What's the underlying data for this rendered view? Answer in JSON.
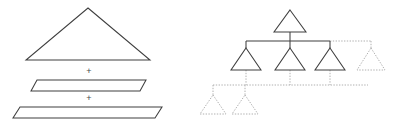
{
  "figure": {
    "width": 398,
    "height": 125,
    "background_color": "#ffffff",
    "solid_stroke_color": "#3f3f3f",
    "dotted_stroke_color": "#b0b0b0",
    "plus_label_color": "#4a4a4a"
  },
  "left_panel": {
    "name": "triangle-decomposition",
    "operators": [
      {
        "symbol": "+",
        "x": 89,
        "y": 72
      },
      {
        "symbol": "+",
        "x": 89,
        "y": 99
      }
    ],
    "shapes": [
      {
        "name": "apex-triangle",
        "kind": "triangle",
        "style": "solid",
        "points": "88,8 150,60 26,60"
      },
      {
        "name": "middle-slab",
        "kind": "parallelogram",
        "style": "solid",
        "points": "37,80 146,80 140,91 31,91"
      },
      {
        "name": "bottom-slab",
        "kind": "parallelogram",
        "style": "solid",
        "points": "20,107 162,107 155,118 13,118"
      }
    ]
  },
  "right_panel": {
    "name": "tree-expansion",
    "nodes": [
      {
        "name": "root-node",
        "style": "solid",
        "cx": 290,
        "cy": 10,
        "half_width": 16,
        "height": 22
      },
      {
        "name": "child-node-1",
        "style": "solid",
        "cx": 246,
        "cy": 48,
        "half_width": 15,
        "height": 22
      },
      {
        "name": "child-node-2",
        "style": "solid",
        "cx": 290,
        "cy": 48,
        "half_width": 15,
        "height": 22
      },
      {
        "name": "child-node-3",
        "style": "solid",
        "cx": 330,
        "cy": 48,
        "half_width": 15,
        "height": 22
      },
      {
        "name": "child-node-4",
        "style": "dotted",
        "cx": 371,
        "cy": 48,
        "half_width": 14,
        "height": 22
      },
      {
        "name": "grandchild-node-1",
        "style": "dotted",
        "cx": 213,
        "cy": 95,
        "half_width": 13,
        "height": 19
      },
      {
        "name": "grandchild-node-2",
        "style": "dotted",
        "cx": 245,
        "cy": 95,
        "half_width": 13,
        "height": 19
      }
    ],
    "edges": [
      {
        "name": "root-stem",
        "style": "solid",
        "path": "M290,32 L290,41"
      },
      {
        "name": "level1-bus-solid",
        "style": "solid",
        "path": "M246,41 L330,41"
      },
      {
        "name": "level1-bus-dotted",
        "style": "dotted",
        "path": "M330,41 L371,41"
      },
      {
        "name": "child-1-riser",
        "style": "solid",
        "path": "M246,41 L246,48"
      },
      {
        "name": "child-2-riser",
        "style": "solid",
        "path": "M290,41 L290,48"
      },
      {
        "name": "child-3-riser",
        "style": "solid",
        "path": "M330,41 L330,48"
      },
      {
        "name": "child-4-riser",
        "style": "dotted",
        "path": "M371,41 L371,48"
      },
      {
        "name": "child-1-stem",
        "style": "dotted",
        "path": "M246,70 L246,85"
      },
      {
        "name": "child-2-stem",
        "style": "dotted",
        "path": "M290,70 L290,85"
      },
      {
        "name": "child-3-stem",
        "style": "dotted",
        "path": "M330,70 L330,85"
      },
      {
        "name": "level2-bus-dotted",
        "style": "dotted",
        "path": "M213,85 L368,85"
      },
      {
        "name": "grandchild-1-riser",
        "style": "dotted",
        "path": "M213,85 L213,95"
      },
      {
        "name": "grandchild-2-riser",
        "style": "dotted",
        "path": "M245,85 L245,95"
      }
    ]
  }
}
